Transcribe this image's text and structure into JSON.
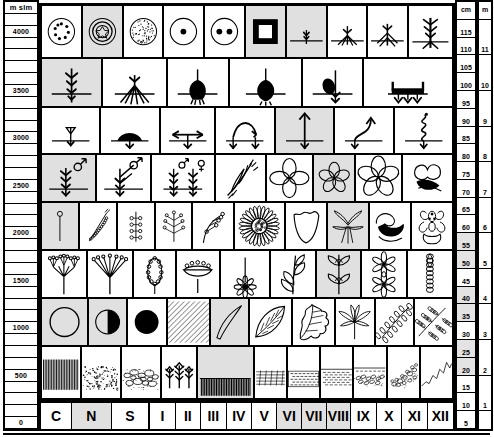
{
  "chart_data": {
    "type": "table",
    "xlabel": "",
    "ylabel": "m slm",
    "grid": true,
    "legend": "none",
    "x_categories": [
      "C",
      "N",
      "S",
      "I",
      "II",
      "III",
      "IV",
      "V",
      "VI",
      "VII",
      "VIII",
      "IX",
      "X",
      "XI",
      "XII"
    ],
    "left_axis": {
      "header": "m slm",
      "unit": "m slm",
      "range": [
        0,
        4250
      ],
      "labels": [
        "4000",
        "3500",
        "3000",
        "2500",
        "2000",
        "1500",
        "1000",
        "500",
        "0"
      ],
      "tick_step": 250
    },
    "right_axis_cm": {
      "header": "cm",
      "unit": "cm",
      "range": [
        0,
        120
      ],
      "labels": [
        "115",
        "110",
        "105",
        "100",
        "95",
        "90",
        "85",
        "80",
        "75",
        "70",
        "65",
        "60",
        "55",
        "50",
        "45",
        "40",
        "35",
        "30",
        "25",
        "20",
        "15",
        "10",
        "5"
      ],
      "tick_step": 5
    },
    "right_axis_m": {
      "header": "m",
      "unit": "m",
      "range": [
        0,
        11
      ],
      "labels": [
        "11",
        "10",
        "9",
        "8",
        "7",
        "6",
        "5",
        "4",
        "3",
        "2",
        "1"
      ],
      "tick_step": 1
    },
    "rows": [
      {
        "name": "seeds-and-roots",
        "symbols": [
          "seed-many-dots",
          "seed-ringed-star",
          "seed-stippled",
          "seed-single-dot",
          "seed-two-dots",
          "square-seed",
          "seedling-single-root",
          "root-fibrous-spread",
          "root-branched",
          "root-taproot-branched"
        ]
      },
      {
        "name": "root-systems",
        "symbols": [
          "root-fibrous-deep",
          "root-fasciculate",
          "bulb-dark",
          "tuber-round",
          "tuber-with-rhizome",
          "rhizome-horizontal"
        ]
      },
      {
        "name": "vegetative-spread",
        "symbols": [
          "arrow-down-node",
          "cushion-mat",
          "stolon-two-way",
          "arching-stem",
          "erect-shoot",
          "curved-shoot",
          "twining-climber"
        ]
      },
      {
        "name": "sex-expression-and-flowers",
        "symbols": [
          "plant-male",
          "plant-male-arrow",
          "plant-male-female",
          "grass-spikelet",
          "flower-4-petal",
          "flower-5-petal",
          "flower-5-petal-open",
          "flower-irregular-lip"
        ]
      },
      {
        "name": "inflorescence-types",
        "symbols": [
          "flower-solitary",
          "spike",
          "raceme",
          "panicle",
          "cyme",
          "capitulum-daisy",
          "flower-campanulate",
          "flower-cruciform",
          "flower-labiate",
          "flower-orchid"
        ]
      },
      {
        "name": "umbels-and-leaf-arrangement",
        "symbols": [
          "umbel-compound",
          "umbel-simple",
          "spadix",
          "corymb",
          "scape-with-rosette-flower",
          "leaves-alternate",
          "leaves-opposite",
          "leaves-whorled",
          "catkin"
        ]
      },
      {
        "name": "light-and-leaf-shape",
        "symbols": [
          "circle-open-full-sun",
          "circle-half-partial-shade",
          "circle-filled-shade",
          "hatched-slope",
          "leaf-linear",
          "leaf-ovate",
          "leaf-lobed",
          "leaf-palmate",
          "leaf-pinnate",
          "leaf-bipinnate"
        ]
      },
      {
        "name": "substrate-and-habitat",
        "symbols": [
          "hatch-vertical-rock",
          "sand-stipple",
          "gravel-cobbles",
          "conifer-forest",
          "grass-sward",
          "rock-bedding",
          "screee-fine",
          "water-wet-meadow",
          "marsh-peat",
          "boulder-field",
          "mountain-profile"
        ]
      }
    ]
  },
  "bottom_labels": [
    {
      "label": "C",
      "shade": false
    },
    {
      "label": "N",
      "shade": true
    },
    {
      "label": "S",
      "shade": false
    },
    {
      "label": "I",
      "shade": false
    },
    {
      "label": "II",
      "shade": false
    },
    {
      "label": "III",
      "shade": false
    },
    {
      "label": "IV",
      "shade": false
    },
    {
      "label": "V",
      "shade": false
    },
    {
      "label": "VI",
      "shade": true
    },
    {
      "label": "VII",
      "shade": true
    },
    {
      "label": "VIII",
      "shade": true
    },
    {
      "label": "IX",
      "shade": false
    },
    {
      "label": "X",
      "shade": false
    },
    {
      "label": "XI",
      "shade": false
    },
    {
      "label": "XII",
      "shade": false
    }
  ],
  "left_ticks": [
    {
      "label": "m slm",
      "head": true
    },
    {
      "label": ""
    },
    {
      "label": "4000"
    },
    {
      "label": ""
    },
    {
      "label": ""
    },
    {
      "label": ""
    },
    {
      "label": ""
    },
    {
      "label": "3500"
    },
    {
      "label": ""
    },
    {
      "label": ""
    },
    {
      "label": ""
    },
    {
      "label": "3000"
    },
    {
      "label": ""
    },
    {
      "label": ""
    },
    {
      "label": ""
    },
    {
      "label": "2500"
    },
    {
      "label": ""
    },
    {
      "label": ""
    },
    {
      "label": ""
    },
    {
      "label": "2000"
    },
    {
      "label": ""
    },
    {
      "label": ""
    },
    {
      "label": ""
    },
    {
      "label": "1500"
    },
    {
      "label": ""
    },
    {
      "label": ""
    },
    {
      "label": ""
    },
    {
      "label": "1000"
    },
    {
      "label": ""
    },
    {
      "label": ""
    },
    {
      "label": ""
    },
    {
      "label": "500"
    },
    {
      "label": ""
    },
    {
      "label": ""
    },
    {
      "label": ""
    },
    {
      "label": "0"
    }
  ],
  "right_cm_ticks": [
    "cm",
    "115",
    "110",
    "105",
    "100",
    "95",
    "90",
    "85",
    "80",
    "75",
    "70",
    "65",
    "60",
    "55",
    "50",
    "45",
    "40",
    "35",
    "30",
    "25",
    "20",
    "15",
    "10",
    "5"
  ],
  "right_m_ticks": [
    "m",
    "",
    "11",
    "",
    "10",
    "",
    "9",
    "",
    "8",
    "",
    "7",
    "",
    "6",
    "",
    "5",
    "",
    "4",
    "",
    "3",
    "",
    "2",
    "",
    "1",
    ""
  ]
}
